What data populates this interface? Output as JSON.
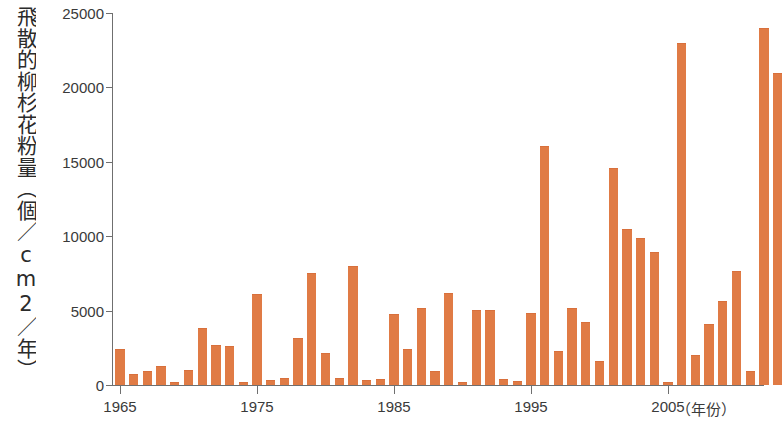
{
  "chart_data": {
    "type": "bar",
    "title": "",
    "ylabel": "飛散的柳杉花粉量（個／cm2／年）",
    "xlabel": "（年份）",
    "ylim": [
      0,
      25000
    ],
    "grid": false,
    "legend": "none",
    "y_ticks": [
      0,
      5000,
      10000,
      15000,
      20000,
      25000
    ],
    "y_tick_labels": [
      "0",
      "5000",
      "10000",
      "15000",
      "20000",
      "25000"
    ],
    "x_ticks": [
      1965,
      1975,
      1985,
      1995,
      2005
    ],
    "x_tick_labels": [
      "1965",
      "1975",
      "1985",
      "1995",
      "2005"
    ],
    "bar_color": "#e07b45",
    "axis_color": "#6f6f6f",
    "categories": [
      1965,
      1966,
      1967,
      1968,
      1969,
      1970,
      1971,
      1972,
      1973,
      1974,
      1975,
      1976,
      1977,
      1978,
      1979,
      1980,
      1981,
      1982,
      1983,
      1984,
      1985,
      1986,
      1987,
      1988,
      1989,
      1990,
      1991,
      1992,
      1993,
      1994,
      1995,
      1996,
      1997,
      1998,
      1999,
      2000,
      2001,
      2002,
      2003,
      2004,
      2005,
      2006,
      2007,
      2008,
      2009,
      2010,
      2011
    ],
    "values": [
      2350,
      700,
      900,
      1200,
      150,
      950,
      3750,
      2650,
      2550,
      150,
      6050,
      300,
      400,
      3100,
      7450,
      2100,
      400,
      7950,
      250,
      350,
      4700,
      2350,
      5100,
      900,
      6100,
      150,
      4950,
      4950,
      350,
      200,
      4750,
      16000,
      2250,
      5100,
      4200,
      1550,
      14500,
      10450,
      9800,
      8900,
      150,
      22900,
      1950,
      4000,
      5550,
      7600,
      900
    ],
    "last_values": [
      23900,
      20900
    ]
  },
  "axis": {
    "y_title": "飛散的柳杉花粉量（個／cm2／年）",
    "x_unit": "（年份）"
  }
}
